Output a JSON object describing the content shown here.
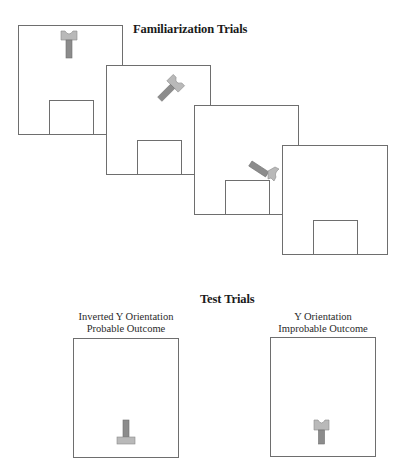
{
  "familiarization": {
    "title": "Familiarization Trials",
    "panels": [
      {
        "id": 1,
        "object_state": "upright-y-above"
      },
      {
        "id": 2,
        "object_state": "tilted-falling"
      },
      {
        "id": 3,
        "object_state": "tilting-onto-box"
      },
      {
        "id": 4,
        "object_state": "empty"
      }
    ]
  },
  "test": {
    "title": "Test Trials",
    "panels": [
      {
        "label_line1": "Inverted Y Orientation",
        "label_line2": "Probable Outcome",
        "object_state": "inverted-y"
      },
      {
        "label_line1": "Y Orientation",
        "label_line2": "Improbable Outcome",
        "object_state": "upright-y"
      }
    ]
  },
  "colors": {
    "frame": "#6e6e6e",
    "head": "#b9b9b9",
    "stem": "#8c8c8c"
  }
}
